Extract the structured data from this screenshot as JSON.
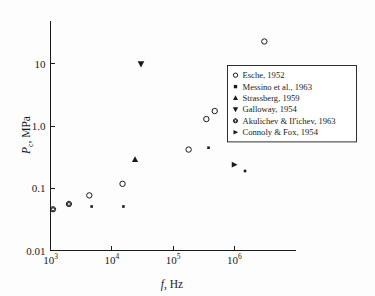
{
  "chart_data": {
    "type": "scatter",
    "title": "",
    "xlabel": "f, Hz",
    "xlabel_symbol": "f",
    "xlabel_unit": ", Hz",
    "ylabel": "Pc, MPa",
    "ylabel_symbol": "P",
    "ylabel_sub": "c",
    "ylabel_unit": ", MPa",
    "xscale": "log",
    "yscale": "log",
    "xlim": [
      1000,
      10000000
    ],
    "ylim": [
      0.01,
      50
    ],
    "grid": false,
    "xticks": [
      {
        "value": 1000,
        "base": "10",
        "exp": "3"
      },
      {
        "value": 10000,
        "base": "10",
        "exp": "4"
      },
      {
        "value": 100000,
        "base": "10",
        "exp": "5"
      },
      {
        "value": 1000000,
        "base": "10",
        "exp": "6"
      }
    ],
    "yticks": [
      {
        "value": 0.01,
        "label": "0.01"
      },
      {
        "value": 0.1,
        "label": "0.1"
      },
      {
        "value": 1.0,
        "label": "1.0"
      },
      {
        "value": 10,
        "label": "10"
      }
    ],
    "legend_position": "upper right",
    "series": [
      {
        "name": "Esche, 1952",
        "marker": "circle-open",
        "points": [
          {
            "x": 15000,
            "y": 0.118
          },
          {
            "x": 4300,
            "y": 0.077
          },
          {
            "x": 180000,
            "y": 0.42
          },
          {
            "x": 350000,
            "y": 1.3
          },
          {
            "x": 480000,
            "y": 1.75
          },
          {
            "x": 3100000,
            "y": 23.0
          }
        ]
      },
      {
        "name": "Messino et al., 1963",
        "marker": "square-filled",
        "points": [
          {
            "x": 1000000,
            "y": 0.7
          }
        ]
      },
      {
        "name": "Strassberg, 1959",
        "marker": "triangle-up-filled",
        "points": [
          {
            "x": 24000,
            "y": 0.29
          }
        ]
      },
      {
        "name": "Galloway, 1954",
        "marker": "triangle-down-filled",
        "points": [
          {
            "x": 30000,
            "y": 10.0
          }
        ]
      },
      {
        "name": "Akulichev & Il'ichev, 1963",
        "marker": "star-circle-open",
        "points": [
          {
            "x": 1100,
            "y": 0.046
          },
          {
            "x": 2000,
            "y": 0.056
          }
        ]
      },
      {
        "name": "Connoly & Fox, 1954",
        "marker": "triangle-right-filled",
        "points": [
          {
            "x": 1000000,
            "y": 0.24
          }
        ]
      },
      {
        "name": "unlabeled-small",
        "marker": "asterisk-small",
        "legend": false,
        "points": [
          {
            "x": 4700,
            "y": 0.051
          },
          {
            "x": 15500,
            "y": 0.051
          },
          {
            "x": 380000,
            "y": 0.45
          },
          {
            "x": 1500000,
            "y": 0.19
          }
        ]
      }
    ],
    "legend_entries": [
      {
        "label": "Esche, 1952",
        "marker": "circle-open"
      },
      {
        "label": "Messino et al., 1963",
        "marker": "square-filled"
      },
      {
        "label": "Strassberg, 1959",
        "marker": "triangle-up-filled"
      },
      {
        "label": "Galloway, 1954",
        "marker": "triangle-down-filled"
      },
      {
        "label": "Akulichev & Il'ichev, 1963",
        "marker": "star-circle-open"
      },
      {
        "label": "Connoly & Fox, 1954",
        "marker": "triangle-right-filled"
      }
    ],
    "colors": {
      "marker": "#1a1a1a",
      "axis": "#1a1a1a",
      "background": "#fdfdfd"
    }
  }
}
